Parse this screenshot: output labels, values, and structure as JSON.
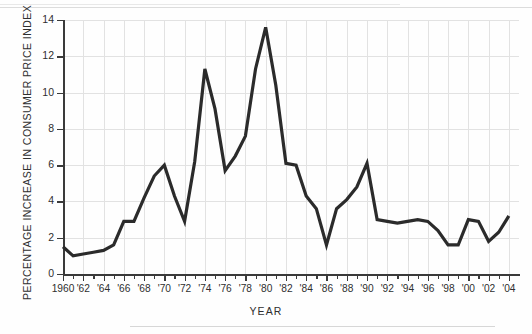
{
  "chart_data": {
    "type": "line",
    "title": "",
    "xlabel": "YEAR",
    "ylabel": "PERCENTAGE INCREASE IN CONSUMER PRICE INDEX",
    "xlim": [
      1960,
      2005
    ],
    "ylim": [
      0,
      14
    ],
    "y_ticks": [
      0,
      2,
      4,
      6,
      8,
      10,
      12,
      14
    ],
    "y_tick_labels": [
      "0",
      "2",
      "4",
      "6",
      "8",
      "10",
      "12",
      "14"
    ],
    "x_ticks": [
      1960,
      1962,
      1964,
      1966,
      1968,
      1970,
      1972,
      1974,
      1976,
      1978,
      1980,
      1982,
      1984,
      1986,
      1988,
      1990,
      1992,
      1994,
      1996,
      1998,
      2000,
      2002,
      2004
    ],
    "x_tick_labels": [
      "1960",
      "'62",
      "'64",
      "'66",
      "'68",
      "'70",
      "'72",
      "'74",
      "'76",
      "'78",
      "'80",
      "'82",
      "'84",
      "'86",
      "'88",
      "'90",
      "'92",
      "'94",
      "'96",
      "'98",
      "'00",
      "'02",
      "'04"
    ],
    "x_minor_tick_interval": 1,
    "grid": true,
    "grid_color": "#e2e2e2",
    "legend": "none",
    "line_color": "#2b2b2b",
    "line_width": 3.2,
    "x": [
      1960,
      1961,
      1962,
      1963,
      1964,
      1965,
      1966,
      1967,
      1968,
      1969,
      1970,
      1971,
      1972,
      1973,
      1974,
      1975,
      1976,
      1977,
      1978,
      1979,
      1980,
      1981,
      1982,
      1983,
      1984,
      1985,
      1986,
      1987,
      1988,
      1989,
      1990,
      1991,
      1992,
      1993,
      1994,
      1995,
      1996,
      1997,
      1998,
      1999,
      2000,
      2001,
      2002,
      2003,
      2004
    ],
    "values": [
      1.5,
      1.0,
      1.1,
      1.2,
      1.3,
      1.6,
      2.9,
      2.9,
      4.2,
      5.4,
      6.0,
      4.3,
      2.9,
      6.2,
      11.3,
      9.1,
      5.7,
      6.5,
      7.6,
      11.3,
      13.6,
      10.4,
      6.1,
      6.0,
      4.3,
      3.6,
      1.6,
      3.6,
      4.1,
      4.8,
      6.1,
      3.0,
      2.9,
      2.8,
      2.9,
      3.0,
      2.9,
      2.4,
      1.6,
      1.6,
      3.0,
      2.9,
      1.8,
      2.3,
      3.2
    ],
    "notable_points": [
      {
        "year": 1980,
        "value": 13.6,
        "note": "series maximum"
      },
      {
        "year": 1974,
        "value": 11.3,
        "note": "local peak"
      },
      {
        "year": 1979,
        "value": 11.3,
        "note": "local peak"
      },
      {
        "year": 1961,
        "value": 1.0,
        "note": "series minimum"
      },
      {
        "year": 1986,
        "value": 1.6,
        "note": "local minimum"
      },
      {
        "year": 1990,
        "value": 6.1,
        "note": "local peak"
      }
    ]
  }
}
